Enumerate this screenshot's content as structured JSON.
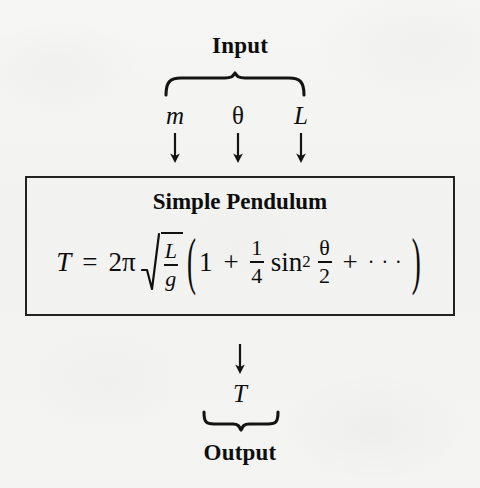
{
  "diagram": {
    "type": "input-output-block-diagram",
    "background_color": "#f4f4f3",
    "ink_color": "#111111"
  },
  "input_section": {
    "heading": "Input",
    "brace_name": "overbrace",
    "variables": [
      {
        "symbol": "m",
        "style": "italic",
        "meaning": "mass"
      },
      {
        "symbol": "θ",
        "style": "upright",
        "meaning": "angle"
      },
      {
        "symbol": "L",
        "style": "italic",
        "meaning": "length"
      }
    ],
    "arrow_glyph": "↓",
    "arrow_count": 3
  },
  "model_box": {
    "title": "Simple Pendulum",
    "border_color": "#222222",
    "formula_plain": "T = 2π√(L/g)(1 + 1/4 sin² θ/2 + ···)",
    "formula": {
      "lhs": "T",
      "equals": "=",
      "coefficient": "2π",
      "radical": {
        "numerator": "L",
        "denominator": "g"
      },
      "open_paren": "(",
      "term_one": "1",
      "plus_one": "+",
      "fraction": {
        "numerator": "1",
        "denominator": "4"
      },
      "function": "sin",
      "exponent": "2",
      "argument": {
        "numerator": "θ",
        "denominator": "2"
      },
      "plus_two": "+",
      "ellipsis": "···",
      "close_paren": ")"
    }
  },
  "output_section": {
    "arrow_glyph": "↓",
    "variable": {
      "symbol": "T",
      "style": "italic",
      "meaning": "period"
    },
    "brace_name": "underbrace",
    "heading": "Output"
  }
}
